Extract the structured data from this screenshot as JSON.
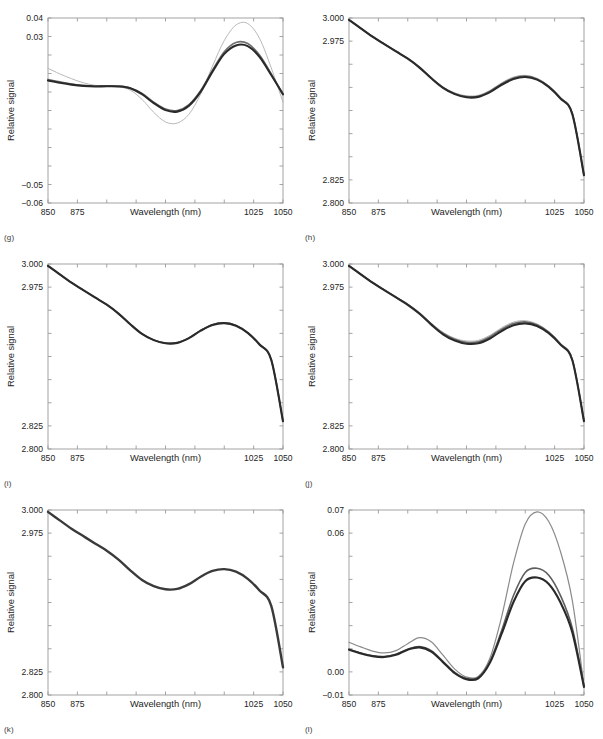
{
  "figure": {
    "background": "#ffffff",
    "width": 603,
    "height": 739,
    "axis_color": "#9a9a9a",
    "series_colors": [
      "#b9b9b9",
      "#6e6e6e",
      "#2a2a2a"
    ]
  },
  "shared": {
    "xlabel": "Wavelength (nm)",
    "ylabel": "Relative signal",
    "xticks": [
      850,
      875,
      900,
      925,
      950,
      975,
      1000,
      1025,
      1050
    ],
    "xticklabels": [
      "850",
      "875",
      "",
      "",
      "",
      "",
      "",
      "1025",
      "1050"
    ],
    "xlim": [
      850,
      1050
    ]
  },
  "panels": [
    {
      "caption": "(g)",
      "chart_data": {
        "type": "line",
        "title": "",
        "xlabel": "Wavelength (nm)",
        "ylabel": "Relative signal",
        "xlim": [
          850,
          1050
        ],
        "ylim": [
          -0.06,
          0.04
        ],
        "grid": false,
        "legend": "none",
        "xticks": [
          850,
          875,
          900,
          925,
          950,
          975,
          1000,
          1025,
          1050
        ],
        "xticklabels": [
          "850",
          "875",
          "",
          "",
          "",
          "",
          "",
          "1025",
          "1050"
        ],
        "yticks": [
          -0.06,
          -0.05,
          -0.04,
          -0.03,
          -0.02,
          -0.01,
          0.0,
          0.01,
          0.02,
          0.03,
          0.04
        ],
        "yticklabels": [
          "-0.06",
          "-0.05",
          "",
          "",
          "",
          "",
          "",
          "",
          "",
          "0.03",
          "0.04"
        ],
        "x": [
          850,
          860,
          870,
          880,
          890,
          900,
          910,
          920,
          930,
          940,
          950,
          960,
          970,
          980,
          990,
          1000,
          1010,
          1020,
          1030,
          1040,
          1050
        ],
        "series": [
          {
            "name": "light-gray",
            "color": "#b9b9b9",
            "width": 1.0,
            "values": [
              0.0128,
              0.0098,
              0.0072,
              0.005,
              0.0036,
              0.0032,
              0.0028,
              0.001,
              -0.004,
              -0.011,
              -0.0162,
              -0.0168,
              -0.012,
              -0.001,
              0.014,
              0.0278,
              0.0362,
              0.037,
              0.029,
              0.013,
              -0.0055
            ]
          },
          {
            "name": "medium-gray",
            "color": "#6e6e6e",
            "width": 1.6,
            "values": [
              0.0068,
              0.0055,
              0.0043,
              0.0035,
              0.0032,
              0.0033,
              0.0032,
              0.0022,
              -0.0008,
              -0.0055,
              -0.0092,
              -0.01,
              -0.0068,
              0.0008,
              0.0118,
              0.0218,
              0.0268,
              0.0262,
              0.02,
              0.0098,
              -0.0015
            ]
          },
          {
            "name": "dark",
            "color": "#2a2a2a",
            "width": 2.1,
            "values": [
              0.0062,
              0.005,
              0.004,
              0.0033,
              0.003,
              0.0031,
              0.003,
              0.002,
              -0.0012,
              -0.006,
              -0.0098,
              -0.0106,
              -0.0074,
              0.0002,
              0.011,
              0.0206,
              0.0252,
              0.0248,
              0.019,
              0.0092,
              -0.0012
            ]
          }
        ]
      }
    },
    {
      "caption": "(h)",
      "chart_data": {
        "type": "line",
        "title": "",
        "xlabel": "Wavelength (nm)",
        "ylabel": "Relative signal",
        "xlim": [
          850,
          1050
        ],
        "ylim": [
          2.8,
          3.0
        ],
        "grid": false,
        "legend": "none",
        "xticks": [
          850,
          875,
          900,
          925,
          950,
          975,
          1000,
          1025,
          1050
        ],
        "xticklabels": [
          "850",
          "875",
          "",
          "",
          "",
          "",
          "",
          "1025",
          "1050"
        ],
        "yticks": [
          2.8,
          2.825,
          2.85,
          2.875,
          2.9,
          2.925,
          2.95,
          2.975,
          3.0
        ],
        "yticklabels": [
          "2.800",
          "2.825",
          "",
          "",
          "",
          "",
          "",
          "2.975",
          "3.000"
        ],
        "x": [
          850,
          860,
          870,
          880,
          890,
          900,
          910,
          920,
          930,
          940,
          950,
          960,
          970,
          980,
          990,
          1000,
          1010,
          1020,
          1030,
          1040,
          1050
        ],
        "series": [
          {
            "name": "light-gray",
            "color": "#b9b9b9",
            "width": 1.0,
            "values": [
              2.998,
              2.989,
              2.98,
              2.972,
              2.964,
              2.9565,
              2.947,
              2.9355,
              2.9255,
              2.919,
              2.916,
              2.9165,
              2.9218,
              2.93,
              2.9362,
              2.938,
              2.9348,
              2.9268,
              2.914,
              2.8972,
              2.83
            ]
          },
          {
            "name": "medium-gray",
            "color": "#6e6e6e",
            "width": 1.6,
            "values": [
              2.998,
              2.989,
              2.98,
              2.972,
              2.964,
              2.9563,
              2.9468,
              2.9352,
              2.925,
              2.9183,
              2.915,
              2.9155,
              2.9208,
              2.929,
              2.9352,
              2.9372,
              2.9342,
              2.9262,
              2.9135,
              2.8968,
              2.83
            ]
          },
          {
            "name": "dark",
            "color": "#2a2a2a",
            "width": 2.1,
            "values": [
              2.998,
              2.9888,
              2.9798,
              2.9718,
              2.9638,
              2.956,
              2.9464,
              2.9348,
              2.9245,
              2.9177,
              2.9143,
              2.9147,
              2.9198,
              2.9278,
              2.934,
              2.9362,
              2.9334,
              2.9256,
              2.913,
              2.8964,
              2.83
            ]
          }
        ]
      }
    },
    {
      "caption": "(i)",
      "chart_data": {
        "type": "line",
        "title": "",
        "xlabel": "Wavelength (nm)",
        "ylabel": "Relative signal",
        "xlim": [
          850,
          1050
        ],
        "ylim": [
          2.8,
          3.0
        ],
        "grid": false,
        "legend": "none",
        "xticks": [
          850,
          875,
          900,
          925,
          950,
          975,
          1000,
          1025,
          1050
        ],
        "xticklabels": [
          "850",
          "875",
          "",
          "",
          "",
          "",
          "",
          "1025",
          "1050"
        ],
        "yticks": [
          2.8,
          2.825,
          2.85,
          2.875,
          2.9,
          2.925,
          2.95,
          2.975,
          3.0
        ],
        "yticklabels": [
          "2.800",
          "2.825",
          "",
          "",
          "",
          "",
          "",
          "2.975",
          "3.000"
        ],
        "x": [
          850,
          860,
          870,
          880,
          890,
          900,
          910,
          920,
          930,
          940,
          950,
          960,
          970,
          980,
          990,
          1000,
          1010,
          1020,
          1030,
          1040,
          1050
        ],
        "series": [
          {
            "name": "light-gray",
            "color": "#b0b0b0",
            "width": 1.0,
            "values": [
              2.998,
              2.9888,
              2.9798,
              2.9718,
              2.9638,
              2.956,
              2.9464,
              2.9348,
              2.9245,
              2.918,
              2.9148,
              2.9152,
              2.9205,
              2.9286,
              2.9348,
              2.9368,
              2.9338,
              2.9258,
              2.9132,
              2.8966,
              2.83
            ]
          },
          {
            "name": "medium-gray",
            "color": "#6e6e6e",
            "width": 1.6,
            "values": [
              2.998,
              2.9888,
              2.9798,
              2.9718,
              2.9638,
              2.956,
              2.9464,
              2.9348,
              2.9244,
              2.9178,
              2.9145,
              2.9149,
              2.9201,
              2.9282,
              2.9344,
              2.9364,
              2.9335,
              2.9256,
              2.9131,
              2.8965,
              2.83
            ]
          },
          {
            "name": "dark",
            "color": "#2a2a2a",
            "width": 2.1,
            "values": [
              2.998,
              2.9888,
              2.9798,
              2.9718,
              2.9638,
              2.956,
              2.9464,
              2.9348,
              2.9244,
              2.9177,
              2.9143,
              2.9147,
              2.9198,
              2.9279,
              2.9341,
              2.9361,
              2.9333,
              2.9255,
              2.913,
              2.8964,
              2.83
            ]
          }
        ]
      }
    },
    {
      "caption": "(j)",
      "chart_data": {
        "type": "line",
        "title": "",
        "xlabel": "Wavelength (nm)",
        "ylabel": "Relative signal",
        "xlim": [
          2.8,
          3.0
        ],
        "ylim": [
          2.8,
          3.0
        ],
        "grid": false,
        "legend": "none",
        "xticks": [
          850,
          875,
          900,
          925,
          950,
          975,
          1000,
          1025,
          1050
        ],
        "xticklabels": [
          "850",
          "875",
          "",
          "",
          "",
          "",
          "",
          "1025",
          "1050"
        ],
        "yticks": [
          2.8,
          2.825,
          2.85,
          2.875,
          2.9,
          2.925,
          2.95,
          2.975,
          3.0
        ],
        "yticklabels": [
          "2.800",
          "2.825",
          "",
          "",
          "",
          "",
          "",
          "2.975",
          "3.000"
        ],
        "x": [
          850,
          860,
          870,
          880,
          890,
          900,
          910,
          920,
          930,
          940,
          950,
          960,
          970,
          980,
          990,
          1000,
          1010,
          1020,
          1030,
          1040,
          1050
        ],
        "series": [
          {
            "name": "light-gray",
            "color": "#b9b9b9",
            "width": 1.0,
            "values": [
              2.998,
              2.989,
              2.9802,
              2.9722,
              2.9642,
              2.9568,
              2.9474,
              2.936,
              2.9262,
              2.9198,
              2.9168,
              2.9175,
              2.923,
              2.9312,
              2.9372,
              2.9388,
              2.9352,
              2.927,
              2.9142,
              2.8974,
              2.831
            ]
          },
          {
            "name": "medium-gray",
            "color": "#6e6e6e",
            "width": 1.6,
            "values": [
              2.998,
              2.9889,
              2.98,
              2.972,
              2.964,
              2.9564,
              2.9469,
              2.9354,
              2.9252,
              2.9186,
              2.9154,
              2.916,
              2.9214,
              2.9296,
              2.9357,
              2.9375,
              2.9343,
              2.9263,
              2.9136,
              2.8969,
              2.8305
            ]
          },
          {
            "name": "dark",
            "color": "#2a2a2a",
            "width": 2.1,
            "values": [
              2.998,
              2.9888,
              2.9798,
              2.9718,
              2.9638,
              2.9558,
              2.9462,
              2.9345,
              2.924,
              2.9172,
              2.9138,
              2.9143,
              2.9195,
              2.9276,
              2.9338,
              2.9358,
              2.933,
              2.9252,
              2.9128,
              2.8962,
              2.83
            ]
          }
        ]
      }
    },
    {
      "caption": "(k)",
      "chart_data": {
        "type": "line",
        "title": "",
        "xlabel": "Wavelength (nm)",
        "ylabel": "Relative signal",
        "xlim": [
          850,
          1050
        ],
        "ylim": [
          2.8,
          3.0
        ],
        "grid": false,
        "legend": "none",
        "xticks": [
          850,
          875,
          900,
          925,
          950,
          975,
          1000,
          1025,
          1050
        ],
        "xticklabels": [
          "850",
          "875",
          "",
          "",
          "",
          "",
          "",
          "1025",
          "1050"
        ],
        "yticks": [
          2.8,
          2.825,
          2.85,
          2.875,
          2.9,
          2.925,
          2.95,
          2.975,
          3.0
        ],
        "yticklabels": [
          "2.800",
          "2.825",
          "",
          "",
          "",
          "",
          "",
          "2.975",
          "3.000"
        ],
        "x": [
          850,
          860,
          870,
          880,
          890,
          900,
          910,
          920,
          930,
          940,
          950,
          960,
          970,
          980,
          990,
          1000,
          1010,
          1020,
          1030,
          1040,
          1050
        ],
        "series": [
          {
            "name": "dark",
            "color": "#3a3a3a",
            "width": 2.4,
            "values": [
              2.998,
              2.9888,
              2.9798,
              2.9718,
              2.9638,
              2.956,
              2.9464,
              2.9348,
              2.9244,
              2.9177,
              2.9143,
              2.9147,
              2.9198,
              2.9279,
              2.9341,
              2.9361,
              2.9333,
              2.9255,
              2.913,
              2.8964,
              2.83
            ]
          }
        ]
      }
    },
    {
      "caption": "(l)",
      "chart_data": {
        "type": "line",
        "title": "",
        "xlabel": "Wavelength (nm)",
        "ylabel": "Relative signal",
        "xlim": [
          850,
          1050
        ],
        "ylim": [
          -0.01,
          0.07
        ],
        "grid": false,
        "legend": "none",
        "xticks": [
          850,
          875,
          900,
          925,
          950,
          975,
          1000,
          1025,
          1050
        ],
        "xticklabels": [
          "850",
          "875",
          "",
          "",
          "",
          "",
          "",
          "1025",
          "1050"
        ],
        "yticks": [
          -0.01,
          0.0,
          0.01,
          0.02,
          0.03,
          0.04,
          0.05,
          0.06,
          0.07
        ],
        "yticklabels": [
          "-0.01",
          "0.00",
          "",
          "",
          "",
          "",
          "",
          "0.06",
          "0.07"
        ],
        "x": [
          850,
          860,
          870,
          880,
          890,
          900,
          910,
          920,
          930,
          940,
          950,
          960,
          970,
          980,
          990,
          1000,
          1010,
          1020,
          1030,
          1040,
          1050
        ],
        "series": [
          {
            "name": "light-gray",
            "color": "#8a8a8a",
            "width": 1.2,
            "values": [
              0.0128,
              0.0108,
              0.009,
              0.0082,
              0.0092,
              0.0122,
              0.0148,
              0.013,
              0.0072,
              0.0012,
              -0.0022,
              -0.002,
              0.006,
              0.024,
              0.047,
              0.064,
              0.0692,
              0.065,
              0.052,
              0.031,
              -0.0062
            ]
          },
          {
            "name": "medium-gray",
            "color": "#5e5e5e",
            "width": 1.6,
            "values": [
              0.0098,
              0.0082,
              0.007,
              0.0066,
              0.0076,
              0.0098,
              0.011,
              0.0092,
              0.0046,
              -0.0002,
              -0.0028,
              -0.0024,
              0.0046,
              0.018,
              0.033,
              0.043,
              0.0448,
              0.0418,
              0.033,
              0.019,
              -0.0062
            ]
          },
          {
            "name": "dark",
            "color": "#2a2a2a",
            "width": 2.1,
            "values": [
              0.0096,
              0.008,
              0.0068,
              0.0064,
              0.0074,
              0.0096,
              0.0106,
              0.0088,
              0.0042,
              -0.0006,
              -0.0032,
              -0.0028,
              0.004,
              0.0166,
              0.0302,
              0.0392,
              0.0408,
              0.038,
              0.03,
              0.0172,
              -0.0065
            ]
          }
        ]
      }
    }
  ]
}
